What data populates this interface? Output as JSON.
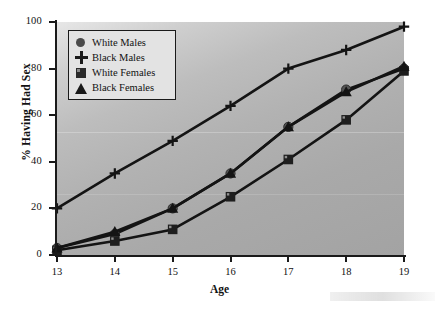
{
  "chart_data": {
    "type": "line",
    "title": "",
    "xlabel": "Age",
    "ylabel": "% Having Had Sex",
    "x": [
      13,
      14,
      15,
      16,
      17,
      18,
      19
    ],
    "xticklabels": [
      "13",
      "14",
      "15",
      "16",
      "17",
      "18",
      "19"
    ],
    "yticklabels": [
      "0",
      "20",
      "40",
      "60",
      "80",
      "100"
    ],
    "yticks": [
      0,
      20,
      40,
      60,
      80,
      100
    ],
    "xlim": [
      13,
      19
    ],
    "ylim": [
      0,
      100
    ],
    "grid": false,
    "legend_position": "upper left",
    "series": [
      {
        "name": "White Males",
        "marker": "circle",
        "values": [
          3,
          9,
          20,
          35,
          55,
          71,
          80
        ]
      },
      {
        "name": "Black Males",
        "marker": "plus",
        "values": [
          20,
          35,
          49,
          64,
          80,
          88,
          98
        ]
      },
      {
        "name": "White Females",
        "marker": "square",
        "values": [
          2,
          6,
          11,
          25,
          41,
          58,
          79
        ]
      },
      {
        "name": "Black Females",
        "marker": "triangle",
        "values": [
          3,
          10,
          20,
          35,
          55,
          70,
          81
        ]
      }
    ]
  },
  "legend": {
    "items": [
      {
        "label": "White Males",
        "marker": "circle-marker"
      },
      {
        "label": "Black Males",
        "marker": "plus-marker"
      },
      {
        "label": "White Females",
        "marker": "square-marker"
      },
      {
        "label": "Black Females",
        "marker": "triangle-marker"
      }
    ]
  },
  "axes": {
    "y_title": "% Having Had Sex",
    "x_title": "Age"
  }
}
